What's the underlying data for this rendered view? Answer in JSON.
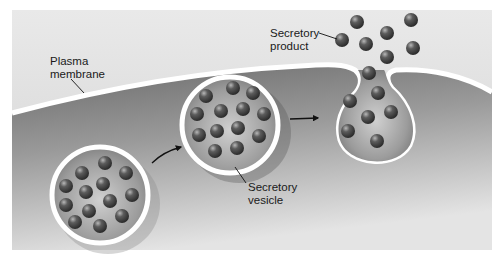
{
  "figure": {
    "labels": {
      "plasma_membrane": "Plasma\nmembrane",
      "secretory_product": "Secretory\nproduct",
      "secretory_vesicle": "Secretory\nvesicle"
    },
    "colors": {
      "background": "#ffffff",
      "extracellular": "#dcdcdc",
      "cytoplasm_dark": "#6e6e6e",
      "cytoplasm_light": "#d6d6d6",
      "membrane": "#ffffff",
      "granule": "#4a4a4a",
      "label_text": "#1a1a1a"
    },
    "stages": [
      {
        "name": "vesicle-in-cytoplasm",
        "granules": 15
      },
      {
        "name": "vesicle-approaching-membrane",
        "granules": 15
      },
      {
        "name": "vesicle-fusing-with-membrane",
        "granules": 8
      }
    ],
    "released_granules": 7
  }
}
